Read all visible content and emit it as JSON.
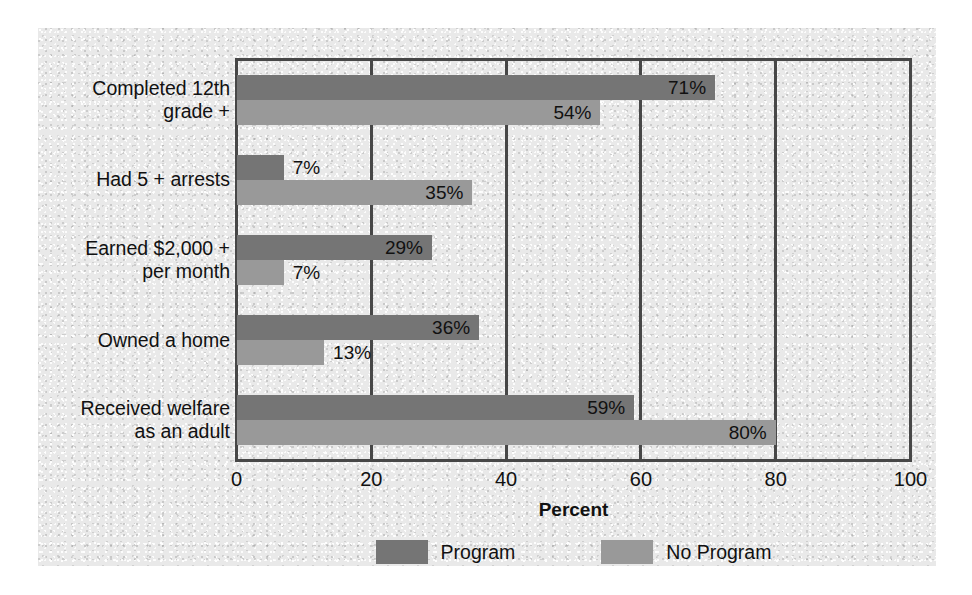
{
  "chart_data": {
    "type": "bar",
    "orientation": "horizontal",
    "title": "",
    "xlabel": "Percent",
    "ylabel": "",
    "xlim": [
      0,
      100
    ],
    "xticks": [
      "0",
      "20",
      "40",
      "60",
      "80",
      "100"
    ],
    "grid": true,
    "legend_position": "bottom",
    "categories": [
      "Completed 12th\ngrade +",
      "Had 5 + arrests",
      "Earned $2,000 +\nper month",
      "Owned a home",
      "Received welfare\nas an adult"
    ],
    "category_lines": [
      [
        "Completed 12th",
        "grade +"
      ],
      [
        "Had 5 + arrests"
      ],
      [
        "Earned $2,000 +",
        "per month"
      ],
      [
        "Owned a home"
      ],
      [
        "Received welfare",
        "as an adult"
      ]
    ],
    "series": [
      {
        "name": "Program",
        "color": "#757575",
        "values": [
          71,
          7,
          29,
          36,
          59
        ],
        "labels": [
          "71%",
          "7%",
          "29%",
          "36%",
          "59%"
        ]
      },
      {
        "name": "No Program",
        "color": "#999999",
        "values": [
          54,
          35,
          7,
          13,
          80
        ],
        "labels": [
          "54%",
          "35%",
          "7%",
          "13%",
          "80%"
        ]
      }
    ]
  },
  "axis": {
    "xlabel": "Percent",
    "ticks": [
      "0",
      "20",
      "40",
      "60",
      "80",
      "100"
    ]
  },
  "legend": {
    "items": [
      {
        "label": "Program",
        "color": "#757575"
      },
      {
        "label": "No Program",
        "color": "#999999"
      }
    ]
  },
  "colors": {
    "program": "#757575",
    "no_program": "#999999",
    "frame": "#474747",
    "background": "#e9e9e9"
  }
}
